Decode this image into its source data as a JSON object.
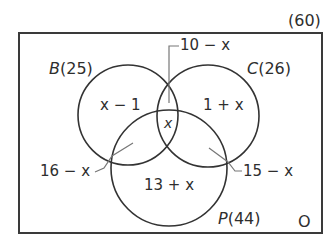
{
  "diagram": {
    "type": "venn",
    "universal_total": "(60)",
    "outside_label": "O",
    "sets": [
      {
        "name": "B",
        "label_name": "B",
        "label_count": "(25)"
      },
      {
        "name": "C",
        "label_name": "C",
        "label_count": "(26)"
      },
      {
        "name": "P",
        "label_name": "P",
        "label_count": "(44)"
      }
    ],
    "regions": {
      "b_only": "x − 1",
      "c_only": "1 + x",
      "p_only": "13 + x",
      "b_c_only": "10 − x",
      "b_p_only": "16 − x",
      "c_p_only": "15 − x",
      "all_three": "x"
    }
  }
}
